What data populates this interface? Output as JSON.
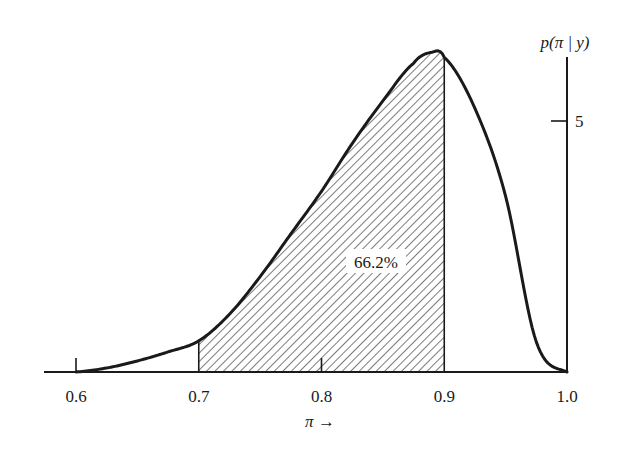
{
  "chart_data": {
    "type": "area",
    "title": "",
    "xlabel": "π →",
    "ylabel": "p(π | y)",
    "xlim": [
      0.6,
      1.0
    ],
    "ylim": [
      0,
      6.4
    ],
    "x_ticks": [
      0.6,
      0.7,
      0.8,
      0.9,
      1.0
    ],
    "x_tick_labels": [
      "0.6",
      "0.7",
      "0.8",
      "0.9",
      "1.0"
    ],
    "y_ticks": [
      5
    ],
    "y_tick_labels": [
      "5"
    ],
    "grid": false,
    "legend": null,
    "series": [
      {
        "name": "posterior density p(π | y)",
        "x": [
          0.6,
          0.625,
          0.65,
          0.675,
          0.7,
          0.725,
          0.75,
          0.775,
          0.8,
          0.825,
          0.85,
          0.875,
          0.89,
          0.9,
          0.925,
          0.95,
          0.975,
          1.0
        ],
        "y": [
          0.0,
          0.08,
          0.22,
          0.4,
          0.62,
          1.15,
          1.9,
          2.75,
          3.6,
          4.55,
          5.4,
          6.15,
          6.37,
          6.27,
          5.25,
          3.5,
          0.6,
          0.0
        ]
      }
    ],
    "shaded_region": {
      "from": 0.7,
      "to": 0.9,
      "pattern": "diagonal-hatch",
      "label": "66.2%"
    },
    "annotations": [
      {
        "text": "66.2%",
        "x": 0.845,
        "y": 2.15
      }
    ]
  },
  "labels": {
    "y_axis_title": "p(π | y)",
    "x_axis_title": "π →",
    "shaded_percent": "66.2%"
  },
  "colors": {
    "ink": "#1a1a1a",
    "hatch": "#333333",
    "background": "#ffffff"
  }
}
